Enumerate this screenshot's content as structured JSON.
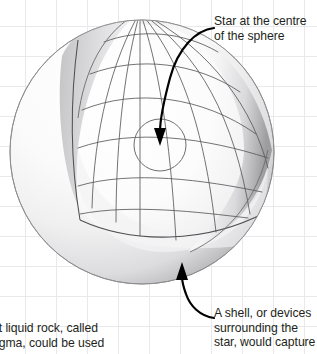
{
  "figure": {
    "name": "dyson-sphere-cutaway-diagram",
    "background": {
      "color": "#ffffff",
      "grid_color": "#e9e9ec",
      "grid_spacing_px": 31
    },
    "sphere": {
      "outer_shell_label": "sphere-outer-shell",
      "cutaway_label": "sphere-cutaway-interior",
      "wireframe_label": "sphere-wireframe-grid",
      "shell_light": "#fdfdfd",
      "shell_mid": "#e2e2e4",
      "shell_dark": "#8e8e90",
      "wire_color": "#58585a",
      "center_x": 142,
      "center_y": 152,
      "radius": 132
    },
    "star": {
      "label": "star-circle",
      "center_x": 160,
      "center_y": 145,
      "radius": 26,
      "stroke": "#6e6e70"
    }
  },
  "callouts": {
    "star": {
      "text": "Star at the centre\nof the sphere",
      "arrow_name": "star-callout-arrow"
    },
    "shell": {
      "text": "A shell, or devices\nsurrounding the\nstar, would capture",
      "arrow_name": "shell-callout-arrow"
    }
  },
  "body_text": {
    "text": "ot liquid rock, called\nagma, could be used"
  },
  "colors": {
    "text": "#231f20",
    "arrow": "#000000"
  }
}
